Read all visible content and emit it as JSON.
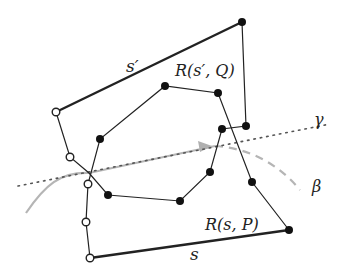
{
  "diagram": {
    "labels": {
      "s_prime": "s′",
      "R_s_prime_Q": "R(s′, Q)",
      "gamma": "γ",
      "beta": "β",
      "R_s_P": "R(s, P)",
      "s": "s"
    },
    "colors": {
      "line": "#222222",
      "gamma": "#666666",
      "beta": "#aaaaaa",
      "arrow": "#b0b0b0"
    },
    "vertices": {
      "open": [
        [
          56,
          112
        ],
        [
          70,
          157
        ],
        [
          88,
          184
        ],
        [
          86,
          222
        ],
        [
          90,
          258
        ]
      ],
      "filled": [
        [
          242,
          22
        ],
        [
          246,
          126
        ],
        [
          222,
          129
        ],
        [
          165,
          86
        ],
        [
          218,
          93
        ],
        [
          100,
          139
        ],
        [
          210,
          172
        ],
        [
          180,
          201
        ],
        [
          108,
          195
        ],
        [
          252,
          182
        ],
        [
          289,
          230
        ]
      ]
    }
  }
}
